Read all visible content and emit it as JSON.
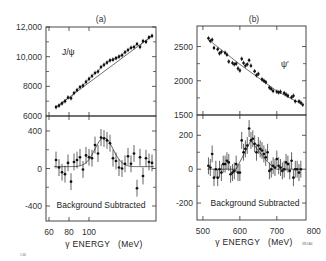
{
  "chart_data": [
    {
      "id": "a",
      "panel_label": "(a)",
      "type": "scatter",
      "xlabel": "γ ENERGY   (MeV)",
      "xlim": [
        57,
        167
      ],
      "xticks": [
        60,
        80,
        100
      ],
      "grid": false,
      "top": {
        "annotation": "J/ψ",
        "ylim": [
          6000,
          12000
        ],
        "yticks": [
          6000,
          8000,
          10000,
          12000
        ],
        "ytick_labels": [
          "6000",
          "8000",
          "10,000",
          "12,000"
        ],
        "x": [
          67,
          70,
          73,
          76,
          79,
          82,
          85,
          88,
          91,
          94,
          97,
          100,
          103,
          106,
          109,
          112,
          115,
          118,
          121,
          124,
          127,
          130,
          133,
          136,
          139,
          142,
          145,
          148,
          151,
          154,
          157,
          160,
          163
        ],
        "y": [
          6600,
          6700,
          6850,
          7000,
          7250,
          7200,
          7550,
          7750,
          7950,
          8050,
          8300,
          8500,
          8700,
          8900,
          9000,
          9300,
          9450,
          9600,
          9750,
          9800,
          9900,
          10000,
          10100,
          10300,
          10450,
          10600,
          10650,
          10850,
          10650,
          11050,
          11000,
          11300,
          11400
        ],
        "background_fit": [
          [
            67,
            6600
          ],
          [
            163,
            11400
          ]
        ],
        "fit_note": "smooth fit with small bump near 110-125 MeV"
      },
      "bottom": {
        "annotation": "Background Subtracted",
        "ylim": [
          -560,
          560
        ],
        "yticks": [
          -400,
          0,
          400
        ],
        "ytick_labels": [
          "-400",
          "0",
          "400"
        ],
        "x": [
          67,
          70,
          73,
          76,
          79,
          82,
          85,
          88,
          91,
          94,
          97,
          100,
          103,
          106,
          109,
          112,
          115,
          118,
          121,
          124,
          127,
          130,
          133,
          136,
          139,
          142,
          145,
          148,
          151,
          154,
          157,
          160,
          163
        ],
        "y": [
          90,
          10,
          -40,
          -60,
          60,
          -140,
          70,
          90,
          120,
          -10,
          140,
          120,
          110,
          250,
          160,
          330,
          320,
          300,
          270,
          110,
          80,
          10,
          0,
          50,
          130,
          50,
          160,
          -210,
          120,
          -80,
          110,
          70,
          60
        ],
        "err": [
          90,
          90,
          90,
          90,
          90,
          90,
          90,
          90,
          90,
          90,
          90,
          90,
          90,
          90,
          90,
          90,
          90,
          90,
          90,
          90,
          90,
          90,
          90,
          90,
          90,
          90,
          90,
          90,
          90,
          90,
          90,
          90,
          90
        ],
        "fit": {
          "type": "gaussian",
          "center": 115,
          "sigma": 9,
          "amplitude": 310,
          "baseline": 20
        }
      }
    },
    {
      "id": "b",
      "panel_label": "(b)",
      "type": "scatter",
      "xlabel": "γ ENERGY   (MeV)",
      "xlim": [
        484,
        779
      ],
      "xticks": [
        500,
        600,
        700,
        800
      ],
      "grid": false,
      "top": {
        "annotation": "ψ′",
        "ylim": [
          1500,
          2800
        ],
        "yticks": [
          1500,
          2000,
          2500
        ],
        "ytick_labels": [
          "1500",
          "2000",
          "2500"
        ],
        "x": [
          515,
          520,
          525,
          530,
          540,
          545,
          550,
          560,
          565,
          570,
          580,
          585,
          590,
          595,
          600,
          605,
          610,
          615,
          620,
          625,
          630,
          640,
          645,
          650,
          660,
          665,
          670,
          680,
          685,
          690,
          700,
          705,
          710,
          720,
          725,
          730,
          740,
          745,
          750,
          760,
          765,
          770
        ],
        "y": [
          2620,
          2580,
          2600,
          2480,
          2460,
          2400,
          2420,
          2410,
          2380,
          2280,
          2260,
          2240,
          2250,
          2180,
          2150,
          2320,
          2260,
          2220,
          2240,
          2300,
          2220,
          2140,
          2080,
          2100,
          2020,
          2000,
          1980,
          1900,
          1880,
          1850,
          1840,
          1830,
          1840,
          1820,
          1800,
          1780,
          1760,
          1780,
          1700,
          1700,
          1680,
          1650
        ],
        "background_fit": [
          [
            515,
            2600
          ],
          [
            600,
            2240
          ],
          [
            700,
            1850
          ],
          [
            770,
            1650
          ]
        ],
        "fit_note": "straight background line drawn from ~600 to ~700 MeV under the bump"
      },
      "bottom": {
        "annotation": "Background Subtracted",
        "ylim": [
          -300,
          320
        ],
        "yticks": [
          -200,
          0,
          200
        ],
        "ytick_labels": [
          "-200",
          "0",
          "200"
        ],
        "x": [
          515,
          520,
          525,
          530,
          535,
          540,
          545,
          550,
          555,
          560,
          565,
          570,
          575,
          580,
          585,
          590,
          595,
          600,
          605,
          610,
          615,
          620,
          625,
          630,
          635,
          640,
          645,
          650,
          655,
          660,
          665,
          670,
          675,
          680,
          685,
          690,
          695,
          700,
          705,
          710,
          715,
          720,
          725,
          730,
          735,
          740,
          745,
          750,
          755,
          760,
          765
        ],
        "y": [
          20,
          10,
          90,
          -50,
          0,
          -50,
          0,
          -20,
          30,
          30,
          50,
          40,
          -30,
          -20,
          -10,
          30,
          -20,
          -20,
          170,
          100,
          120,
          140,
          240,
          170,
          180,
          150,
          100,
          140,
          120,
          110,
          90,
          70,
          100,
          -10,
          0,
          20,
          10,
          60,
          20,
          10,
          -10,
          0,
          40,
          30,
          -10,
          50,
          -50,
          0,
          0,
          -20,
          0
        ],
        "err": [
          50,
          50,
          50,
          50,
          50,
          50,
          50,
          50,
          50,
          50,
          50,
          50,
          50,
          50,
          50,
          50,
          50,
          50,
          50,
          50,
          50,
          50,
          50,
          50,
          50,
          50,
          50,
          50,
          50,
          50,
          50,
          50,
          50,
          50,
          50,
          50,
          50,
          50,
          50,
          50,
          50,
          50,
          50,
          50,
          50,
          50,
          50,
          50,
          50,
          50,
          50
        ],
        "fit": {
          "type": "asymmetric_peak",
          "center": 630,
          "peak": 170,
          "left_start": 590,
          "right_end": 700,
          "baseline": 0
        }
      }
    }
  ],
  "footnotes": {
    "left_id": "1-80",
    "right_id": "3851A4"
  }
}
